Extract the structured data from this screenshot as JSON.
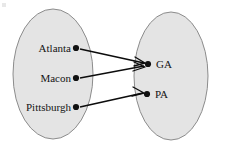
{
  "figure": {
    "type": "function-mapping-diagram",
    "width": 226,
    "height": 150,
    "background_color": "#ffffff"
  },
  "colors": {
    "set_fill": "#e4e4e4",
    "set_stroke": "#8c8c8c",
    "dot": "#111111",
    "arrow": "#0c0c0c",
    "label": "#141414"
  },
  "domain_set": {
    "name": "domain-oval",
    "cx": 53,
    "cy": 74,
    "rx": 40,
    "ry": 65,
    "nodes": [
      {
        "label": "Atlanta",
        "dot_x": 76,
        "dot_y": 48,
        "label_x": 71,
        "label_y": 52
      },
      {
        "label": "Macon",
        "dot_x": 76,
        "dot_y": 78,
        "label_x": 71,
        "label_y": 82
      },
      {
        "label": "Pittsburgh",
        "dot_x": 76,
        "dot_y": 107,
        "label_x": 71,
        "label_y": 111
      }
    ]
  },
  "codomain_set": {
    "name": "codomain-oval",
    "cx": 171,
    "cy": 76,
    "rx": 37,
    "ry": 64,
    "nodes": [
      {
        "label": "GA",
        "dot_x": 148,
        "dot_y": 64,
        "label_x": 156,
        "label_y": 68
      },
      {
        "label": "PA",
        "dot_x": 147,
        "dot_y": 94,
        "label_x": 155,
        "label_y": 98
      }
    ]
  },
  "mappings": [
    {
      "from": "Atlanta",
      "to": "GA",
      "x1": 80,
      "y1": 49,
      "x2": 144,
      "y2": 63
    },
    {
      "from": "Macon",
      "to": "GA",
      "x1": 80,
      "y1": 78,
      "x2": 144,
      "y2": 66
    },
    {
      "from": "Pittsburgh",
      "to": "PA",
      "x1": 80,
      "y1": 107,
      "x2": 143,
      "y2": 93
    }
  ]
}
